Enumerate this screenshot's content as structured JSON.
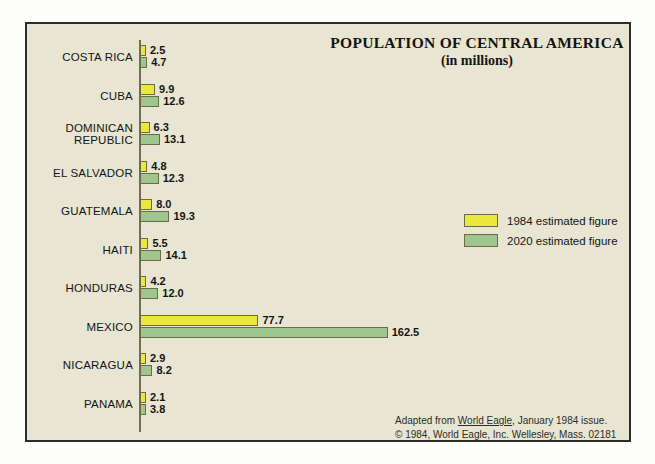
{
  "chart_data": {
    "type": "bar",
    "orientation": "horizontal",
    "title": "POPULATION OF CENTRAL AMERICA",
    "subtitle": "(in millions)",
    "xlabel": "",
    "ylabel": "",
    "grid": false,
    "xlim": [
      0,
      170
    ],
    "legend_position": "right-middle",
    "categories": [
      "COSTA RICA",
      "CUBA",
      "DOMINICAN REPUBLIC",
      "EL SALVADOR",
      "GUATEMALA",
      "HAITI",
      "HONDURAS",
      "MEXICO",
      "NICARAGUA",
      "PANAMA"
    ],
    "series": [
      {
        "name": "1984 estimated figure",
        "color": "#ece73c",
        "values": [
          2.5,
          9.9,
          6.3,
          4.8,
          8.0,
          5.5,
          4.2,
          77.7,
          2.9,
          2.1
        ]
      },
      {
        "name": "2020 estimated figure",
        "color": "#9ec68e",
        "values": [
          4.7,
          12.6,
          13.1,
          12.3,
          19.3,
          14.1,
          12.0,
          162.5,
          8.2,
          3.8
        ]
      }
    ]
  },
  "rows": [
    {
      "label_line1": "COSTA RICA",
      "label_line2": "",
      "v1984": "2.5",
      "v2020": "4.7"
    },
    {
      "label_line1": "CUBA",
      "label_line2": "",
      "v1984": "9.9",
      "v2020": "12.6"
    },
    {
      "label_line1": "DOMINICAN",
      "label_line2": "REPUBLIC",
      "v1984": "6.3",
      "v2020": "13.1"
    },
    {
      "label_line1": "EL SALVADOR",
      "label_line2": "",
      "v1984": "4.8",
      "v2020": "12.3"
    },
    {
      "label_line1": "GUATEMALA",
      "label_line2": "",
      "v1984": "8.0",
      "v2020": "19.3"
    },
    {
      "label_line1": "HAITI",
      "label_line2": "",
      "v1984": "5.5",
      "v2020": "14.1"
    },
    {
      "label_line1": "HONDURAS",
      "label_line2": "",
      "v1984": "4.2",
      "v2020": "12.0"
    },
    {
      "label_line1": "MEXICO",
      "label_line2": "",
      "v1984": "77.7",
      "v2020": "162.5"
    },
    {
      "label_line1": "NICARAGUA",
      "label_line2": "",
      "v1984": "2.9",
      "v2020": "8.2"
    },
    {
      "label_line1": "PANAMA",
      "label_line2": "",
      "v1984": "2.1",
      "v2020": "3.8"
    }
  ],
  "legend": {
    "items": [
      {
        "label": "1984 estimated figure",
        "color": "#ece73c"
      },
      {
        "label": "2020 estimated figure",
        "color": "#9ec68e"
      }
    ]
  },
  "footer": {
    "line1_prefix": "Adapted from ",
    "line1_source": "World Eagle",
    "line1_suffix": ", January 1984 issue.",
    "line2": "© 1984, World Eagle, Inc. Wellesley, Mass. 02181"
  },
  "colors": {
    "panel_background": "#e8e6d2",
    "frame_border": "#2b2b28",
    "bar_1984": "#ece73c",
    "bar_2020": "#9ec68e",
    "bar_outline": "#6b6c45",
    "axis": "#6e6f55",
    "text": "#141412"
  }
}
